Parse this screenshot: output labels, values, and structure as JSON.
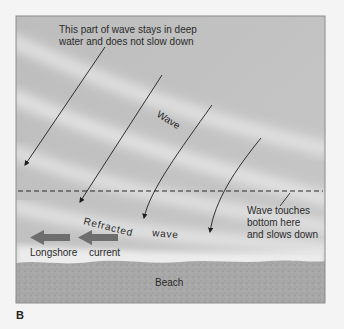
{
  "figure": {
    "panel_label": "B",
    "labels": {
      "deep_water_line1": "This part of wave stays in deep",
      "deep_water_line2": "water and does not slow down",
      "wave": "Wave",
      "refracted": "Refracted",
      "refracted_wave": "wave",
      "touch_line1": "Wave touches",
      "touch_line2": "bottom here",
      "touch_line3": "and slows down",
      "longshore": "Longshore",
      "current": "current",
      "beach": "Beach"
    },
    "colors": {
      "water": "#c9c9c9",
      "wave_crest": "#e6e6e6",
      "beach": "#a9a9a9",
      "current_arrow": "#6e6e6e",
      "line": "#2a2a2a",
      "frame": "#8a8a8a"
    }
  }
}
